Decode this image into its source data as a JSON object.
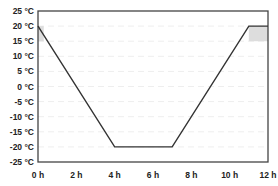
{
  "chart_data": {
    "type": "line",
    "title": "",
    "xlabel": "",
    "ylabel": "",
    "x": [
      0,
      4,
      7,
      11,
      12
    ],
    "series": [
      {
        "name": "Temperature profile",
        "values": [
          20,
          -20,
          -20,
          20,
          20
        ],
        "color": "#333333"
      }
    ],
    "shaded_regions": [
      {
        "x": [
          0,
          0.3
        ],
        "y": [
          15,
          20
        ],
        "color": "#dddddd"
      },
      {
        "x": [
          11,
          12
        ],
        "y": [
          15,
          20
        ],
        "color": "#dddddd"
      }
    ],
    "xlim": [
      0,
      12
    ],
    "ylim": [
      -25,
      25
    ],
    "x_ticks": [
      "0 h",
      "2 h",
      "4 h",
      "6 h",
      "8 h",
      "10 h",
      "12 h"
    ],
    "y_ticks": [
      "25 °C",
      "20 °C",
      "15 °C",
      "10 °C",
      "5 °C",
      "0 °C",
      "-5 °C",
      "-10 °C",
      "-15 °C",
      "-20 °C",
      "-25 °C"
    ],
    "grid": true,
    "legend": "none"
  }
}
